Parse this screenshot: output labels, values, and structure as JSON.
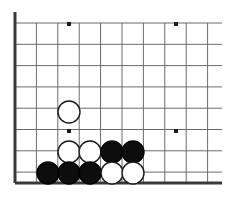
{
  "diagram": {
    "kind": "go-board-diagram",
    "board": {
      "background_color": "#ffffff",
      "grid_line_color": "#6b6b6b",
      "edge_line_color": "#3a3a3a",
      "grid_line_width": 1,
      "edge_line_width": 3,
      "origin_x": 15,
      "origin_y": 23,
      "spacing_x": 21.4,
      "spacing_y": 21.3,
      "columns": 10,
      "rows": 8,
      "left_edge_x": 15,
      "bottom_edge_y": 183,
      "left_edge_top_y": 12,
      "bottom_edge_right_x": 222,
      "grid_right_x": 222,
      "grid_top_y": 23
    },
    "star_points": {
      "color": "#1a1a1a",
      "size": 4,
      "points": [
        {
          "x": 69,
          "y": 24,
          "label": "star-top-left"
        },
        {
          "x": 176,
          "y": 24,
          "label": "star-top-right"
        },
        {
          "x": 69,
          "y": 131,
          "label": "star-bottom-left"
        },
        {
          "x": 176,
          "y": 131,
          "label": "star-bottom-right"
        }
      ]
    },
    "stones": {
      "radius": 11,
      "black_fill": "#0d0d0d",
      "black_stroke": "#000000",
      "white_fill": "#ffffff",
      "white_stroke": "#1a1a1a",
      "stroke_width": 1.4,
      "items": [
        {
          "id": "w1",
          "color": "white",
          "x": 69,
          "y": 112
        },
        {
          "id": "w2",
          "color": "white",
          "x": 69,
          "y": 152
        },
        {
          "id": "w3",
          "color": "white",
          "x": 90,
          "y": 152
        },
        {
          "id": "b1",
          "color": "black",
          "x": 112,
          "y": 152
        },
        {
          "id": "b2",
          "color": "black",
          "x": 133,
          "y": 152
        },
        {
          "id": "b3",
          "color": "black",
          "x": 48,
          "y": 173
        },
        {
          "id": "b4",
          "color": "black",
          "x": 69,
          "y": 173
        },
        {
          "id": "b5",
          "color": "black",
          "x": 90,
          "y": 173
        },
        {
          "id": "w4",
          "color": "white",
          "x": 112,
          "y": 173
        },
        {
          "id": "w5",
          "color": "white",
          "x": 133,
          "y": 173
        }
      ]
    }
  }
}
